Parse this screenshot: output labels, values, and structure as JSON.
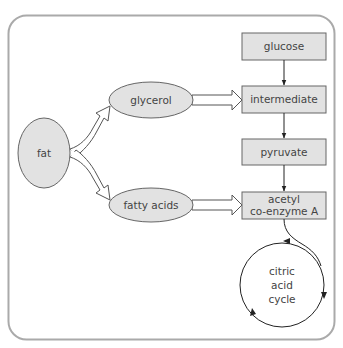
{
  "diagram": {
    "colors": {
      "shape_fill": "#e2e2e2",
      "shape_stroke": "#666666",
      "frame_stroke": "#aaaaaa",
      "arrow_stroke": "#222222",
      "text": "#444444"
    },
    "nodes": {
      "fat": "fat",
      "glycerol": "glycerol",
      "fatty_acids": "fatty acids",
      "glucose": "glucose",
      "intermediate": "intermediate",
      "pyruvate": "pyruvate",
      "acetyl_line1": "acetyl",
      "acetyl_line2": "co-enzyme A",
      "cycle_line1": "citric",
      "cycle_line2": "acid",
      "cycle_line3": "cycle"
    },
    "edges": [
      {
        "from": "fat",
        "to": "glycerol",
        "style": "hollow"
      },
      {
        "from": "fat",
        "to": "fatty acids",
        "style": "hollow"
      },
      {
        "from": "glycerol",
        "to": "intermediate",
        "style": "hollow"
      },
      {
        "from": "fatty acids",
        "to": "acetyl co-enzyme A",
        "style": "hollow"
      },
      {
        "from": "glucose",
        "to": "intermediate",
        "style": "solid"
      },
      {
        "from": "intermediate",
        "to": "pyruvate",
        "style": "solid"
      },
      {
        "from": "pyruvate",
        "to": "acetyl co-enzyme A",
        "style": "solid"
      },
      {
        "from": "acetyl co-enzyme A",
        "to": "citric acid cycle",
        "style": "curved"
      }
    ]
  }
}
